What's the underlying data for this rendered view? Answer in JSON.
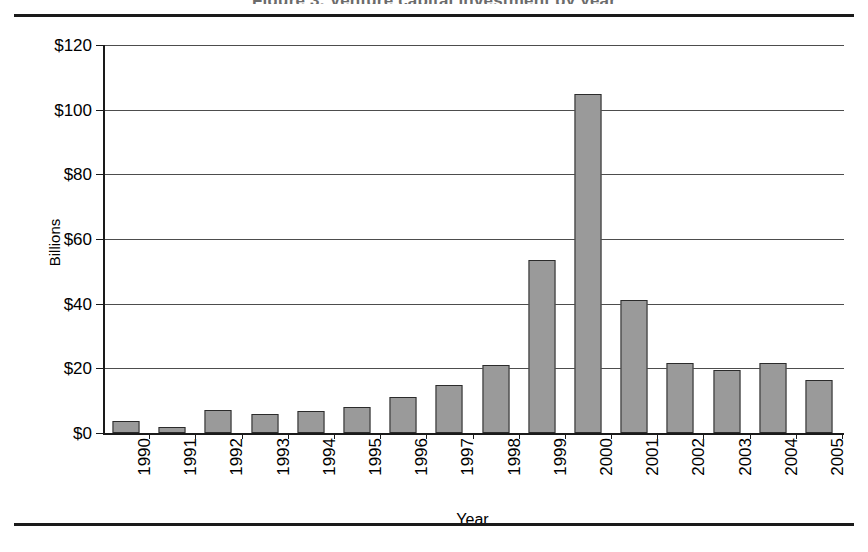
{
  "page": {
    "partial_heading": "Figure 3. Venture capital investment by year",
    "rules": {
      "top": true,
      "bottom": true
    }
  },
  "chart_data": {
    "type": "bar",
    "title": "",
    "xlabel": "Year",
    "ylabel": "Billions",
    "categories": [
      "1990",
      "1991",
      "1992",
      "1993",
      "1994",
      "1995",
      "1996",
      "1997",
      "1998",
      "1999",
      "2000",
      "2001",
      "2002",
      "2003",
      "2004",
      "2005"
    ],
    "values": [
      3.8,
      2.0,
      7.0,
      5.8,
      6.8,
      8.0,
      11.0,
      14.8,
      21.0,
      53.5,
      105.0,
      41.0,
      21.8,
      19.6,
      21.6,
      16.4
    ],
    "ylim": [
      0,
      120
    ],
    "ytick_values": [
      0,
      20,
      40,
      60,
      80,
      100,
      120
    ],
    "ytick_labels": [
      "$0",
      "$20",
      "$40",
      "$60",
      "$80",
      "$100",
      "$120"
    ],
    "grid": true,
    "legend": "none",
    "bar_fill_color": "#9a9a9a",
    "bar_border_color": "#2b2b2b",
    "axis_color": "#1a1a1a",
    "grid_color": "#4d4d4d",
    "background_color": "#ffffff"
  }
}
